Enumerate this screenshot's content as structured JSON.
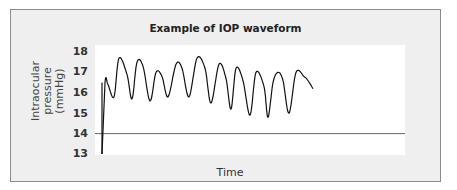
{
  "chart_data": {
    "type": "line",
    "title": "Example of IOP waveform",
    "xlabel": "Time",
    "ylabel_line1": "Intraocular pressure",
    "ylabel_line2": "(mmHg)",
    "yticks": [
      "18",
      "17",
      "16",
      "15",
      "14",
      "13"
    ],
    "ylim": [
      13,
      18
    ],
    "grid": false,
    "legend": null,
    "reference_line": 14,
    "series": [
      {
        "name": "IOP",
        "x": [
          0,
          3,
          6,
          12,
          17,
          25,
          30,
          35,
          41,
          48,
          54,
          60,
          66,
          74,
          80,
          87,
          95,
          103,
          109,
          117,
          124,
          129,
          134,
          141,
          148,
          154,
          162,
          166,
          171,
          176,
          181,
          187,
          194,
          202,
          206,
          211
        ],
        "values": [
          13.0,
          16.5,
          16.4,
          15.8,
          17.7,
          16.9,
          15.7,
          17.5,
          17.3,
          15.6,
          17.0,
          16.8,
          15.8,
          17.4,
          17.2,
          15.8,
          17.7,
          17.2,
          15.5,
          17.4,
          16.7,
          15.2,
          17.2,
          16.6,
          14.9,
          17.0,
          16.3,
          14.8,
          16.5,
          17.0,
          16.6,
          15.0,
          17.0,
          16.8,
          16.6,
          16.2
        ]
      }
    ]
  }
}
